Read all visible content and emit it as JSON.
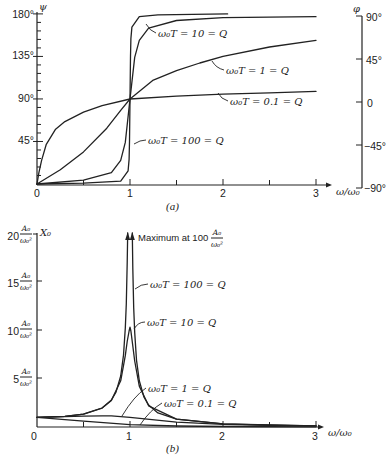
{
  "chart_data": [
    {
      "panel": "a",
      "type": "line",
      "caption": "(a)",
      "xlabel": "ω/ω₀",
      "ylabel": "ψ",
      "y2label": "φ",
      "xlim": [
        0,
        3
      ],
      "ylim": [
        0,
        180
      ],
      "y2lim": [
        -90,
        90
      ],
      "xticks": [
        "0",
        "1",
        "2",
        "3"
      ],
      "yticks": [
        "45°",
        "90°",
        "135°",
        "180°"
      ],
      "y2ticks": [
        "90°",
        "45°",
        "0",
        "−45°",
        "−90°"
      ],
      "grid": false,
      "series": [
        {
          "name": "ω₀T = 0.1 = Q",
          "points": [
            [
              0,
              0
            ],
            [
              0.02,
              12
            ],
            [
              0.05,
              25
            ],
            [
              0.1,
              42
            ],
            [
              0.2,
              58
            ],
            [
              0.3,
              66
            ],
            [
              0.5,
              76
            ],
            [
              0.7,
              83
            ],
            [
              1,
              90
            ],
            [
              1.5,
              93
            ],
            [
              2,
              95
            ],
            [
              2.5,
              96.5
            ],
            [
              3,
              98
            ]
          ]
        },
        {
          "name": "ω₀T = 1 = Q",
          "points": [
            [
              0,
              0
            ],
            [
              0.25,
              15
            ],
            [
              0.5,
              34
            ],
            [
              0.75,
              59
            ],
            [
              0.9,
              78
            ],
            [
              1,
              90
            ],
            [
              1.25,
              110
            ],
            [
              1.5,
              120
            ],
            [
              1.75,
              128
            ],
            [
              2,
              135
            ],
            [
              2.5,
              145
            ],
            [
              3,
              152
            ]
          ]
        },
        {
          "name": "ω₀T = 10 = Q",
          "points": [
            [
              0,
              0
            ],
            [
              0.5,
              4
            ],
            [
              0.8,
              12
            ],
            [
              0.9,
              25
            ],
            [
              0.95,
              44
            ],
            [
              1,
              90
            ],
            [
              1.05,
              134
            ],
            [
              1.1,
              152
            ],
            [
              1.2,
              165
            ],
            [
              1.5,
              173
            ],
            [
              2,
              176
            ],
            [
              3,
              177
            ]
          ]
        },
        {
          "name": "ω₀T = 100 = Q",
          "points": [
            [
              0,
              0
            ],
            [
              0.5,
              0.8
            ],
            [
              0.9,
              3
            ],
            [
              0.98,
              14
            ],
            [
              0.99,
              26
            ],
            [
              0.995,
              45
            ],
            [
              1,
              90
            ],
            [
              1.005,
              135
            ],
            [
              1.01,
              154
            ],
            [
              1.02,
              166
            ],
            [
              1.1,
              177
            ],
            [
              1.3,
              179
            ],
            [
              2.05,
              180
            ]
          ]
        }
      ]
    },
    {
      "panel": "b",
      "type": "line",
      "caption": "(b)",
      "xlabel": "ω/ω₀",
      "ylabel": "X₀",
      "xlim": [
        0,
        3
      ],
      "ylim": [
        0,
        20
      ],
      "xticks": [
        "0",
        "1",
        "2",
        "3"
      ],
      "yticks": [
        {
          "value": "5",
          "num": "A₀",
          "den": "ω₀²"
        },
        {
          "value": "10",
          "num": "A₀",
          "den": "ω₀²"
        },
        {
          "value": "15",
          "num": "A₀",
          "den": "ω₀²"
        },
        {
          "value": "20",
          "num": "A₀",
          "den": "ω₀²"
        }
      ],
      "annotation": {
        "text": "Maximum at 100",
        "num": "A₀",
        "den": "ω₀²",
        "peak_value": 100
      },
      "grid": false,
      "series": [
        {
          "name": "ω₀T = 100 = Q",
          "segments": [
            [
              [
                0,
                1
              ],
              [
                0.3,
                1.1
              ],
              [
                0.5,
                1.33
              ],
              [
                0.7,
                1.96
              ],
              [
                0.8,
                2.78
              ],
              [
                0.85,
                3.6
              ],
              [
                0.9,
                5.26
              ],
              [
                0.93,
                7.4
              ],
              [
                0.95,
                10.2
              ],
              [
                0.96,
                12.7
              ],
              [
                0.97,
                16.9
              ],
              [
                0.975,
                20
              ]
            ],
            [
              [
                1.025,
                20
              ],
              [
                1.03,
                16.4
              ],
              [
                1.04,
                12.3
              ],
              [
                1.05,
                9.75
              ],
              [
                1.07,
                6.9
              ],
              [
                1.1,
                4.76
              ],
              [
                1.15,
                3.1
              ],
              [
                1.2,
                2.27
              ],
              [
                1.3,
                1.45
              ],
              [
                1.5,
                0.8
              ],
              [
                2,
                0.33
              ],
              [
                2.5,
                0.19
              ],
              [
                3,
                0.12
              ]
            ]
          ]
        },
        {
          "name": "ω₀T = 10 = Q",
          "points": [
            [
              0,
              1
            ],
            [
              0.3,
              1.1
            ],
            [
              0.5,
              1.33
            ],
            [
              0.7,
              1.95
            ],
            [
              0.8,
              2.74
            ],
            [
              0.9,
              4.76
            ],
            [
              0.95,
              7.35
            ],
            [
              0.97,
              8.81
            ],
            [
              0.99,
              9.9
            ],
            [
              1,
              10.3
            ],
            [
              1.01,
              9.9
            ],
            [
              1.03,
              8.36
            ],
            [
              1.05,
              6.8
            ],
            [
              1.1,
              4.22
            ],
            [
              1.2,
              2.19
            ],
            [
              1.5,
              0.8
            ],
            [
              2,
              0.33
            ],
            [
              3,
              0.12
            ]
          ]
        },
        {
          "name": "ω₀T = 1 = Q",
          "points": [
            [
              0,
              1
            ],
            [
              0.5,
              1.11
            ],
            [
              0.7,
              1.15
            ],
            [
              0.8,
              1.14
            ],
            [
              1,
              1
            ],
            [
              1.5,
              0.51
            ],
            [
              2,
              0.28
            ],
            [
              2.5,
              0.17
            ],
            [
              3,
              0.12
            ]
          ]
        },
        {
          "name": "ω₀T = 0.1 = Q",
          "points": [
            [
              0,
              1
            ],
            [
              0.5,
              0.6
            ],
            [
              1,
              0.25
            ],
            [
              1.5,
              0.1
            ],
            [
              2,
              0.05
            ],
            [
              3,
              0.02
            ]
          ]
        }
      ]
    }
  ]
}
